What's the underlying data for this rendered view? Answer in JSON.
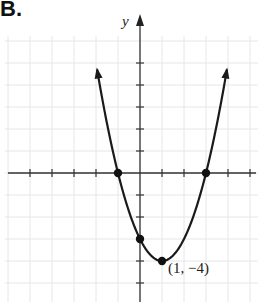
{
  "panel_label": "B.",
  "chart_data": {
    "type": "line",
    "title": "",
    "xlabel": "",
    "ylabel": "y",
    "function": "y = (x - 1)^2 - 4",
    "xlim": [
      -5.5,
      5.5
    ],
    "ylim": [
      -4.5,
      7
    ],
    "grid": true,
    "tick_spacing": 1,
    "points": [
      {
        "x": -1,
        "y": 0,
        "label": ""
      },
      {
        "x": 3,
        "y": 0,
        "label": ""
      },
      {
        "x": 0,
        "y": -3,
        "label": ""
      },
      {
        "x": 1,
        "y": -4,
        "label": "(1, −4)"
      }
    ],
    "series": [
      {
        "name": "parabola",
        "x": [
          -1.8,
          -1,
          0,
          1,
          2,
          3,
          3.8
        ],
        "y": [
          3.84,
          0,
          -3,
          -4,
          -3,
          0,
          3.84
        ]
      }
    ]
  }
}
